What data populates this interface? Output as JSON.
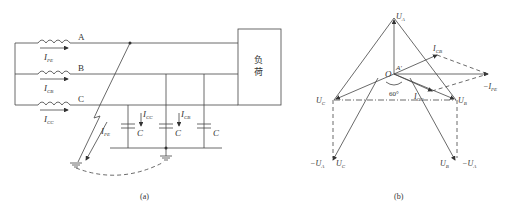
{
  "figure_a": {
    "caption": "(a)",
    "phases": [
      "A",
      "B",
      "C"
    ],
    "currents": {
      "ipe_a": "I",
      "ipe_a_sub": "PE",
      "icb": "I",
      "icb_sub": "CB",
      "icc": "I",
      "icc_sub": "CC",
      "ipe_fault": "I",
      "ipe_fault_sub": "PE",
      "icc2": "I",
      "icc2_sub": "CC",
      "icb2": "I",
      "icb2_sub": "CB"
    },
    "capacitor_label": "C",
    "load_label_1": "负",
    "load_label_2": "荷"
  },
  "figure_b": {
    "caption": "(b)",
    "labels": {
      "ua": "U",
      "ua_sub": "A",
      "ub": "U",
      "ub_sub": "B",
      "uc": "U",
      "uc_sub": "C",
      "o": "O",
      "a_prime": "A'",
      "angle": "60°",
      "icb": "I",
      "icb_sub": "CB",
      "icc": "I",
      "icc_sub": "CC",
      "neg_ipe": "−I",
      "neg_ipe_sub": "PE",
      "neg_ua_left": "−U",
      "neg_ua_left_sub": "A",
      "uc_prime": "U",
      "uc_prime_sub": "C",
      "ub_prime": "U",
      "ub_prime_sub": "B",
      "neg_ua_right": "−U",
      "neg_ua_right_sub": "A"
    }
  }
}
